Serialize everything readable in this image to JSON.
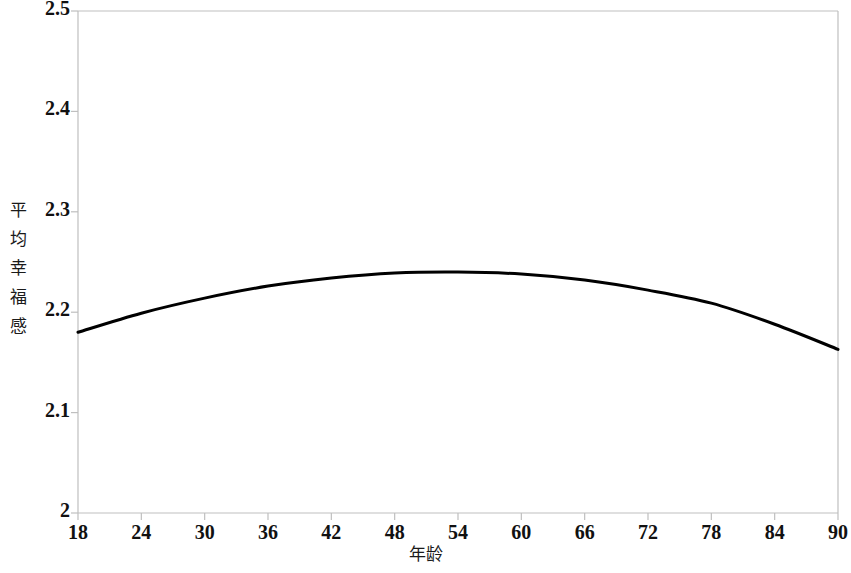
{
  "chart_data": {
    "type": "line",
    "title": "",
    "xlabel": "年龄",
    "ylabel": "平均幸福感",
    "xlim": [
      18,
      90
    ],
    "ylim": [
      2,
      2.5
    ],
    "xticks": [
      18,
      24,
      30,
      36,
      42,
      48,
      54,
      60,
      66,
      72,
      78,
      84,
      90
    ],
    "yticks": [
      2,
      2.1,
      2.2,
      2.3,
      2.4,
      2.5
    ],
    "ytick_labels": [
      "2",
      "2.1",
      "2.2",
      "2.3",
      "2.4",
      "2.5"
    ],
    "xtick_labels": [
      "18",
      "24",
      "30",
      "36",
      "42",
      "48",
      "54",
      "60",
      "66",
      "72",
      "78",
      "84",
      "90"
    ],
    "grid": false,
    "legend": null,
    "series": [
      {
        "name": "平均幸福感",
        "color": "#000000",
        "linewidth": 3,
        "x": [
          18,
          24,
          30,
          36,
          42,
          48,
          54,
          60,
          66,
          72,
          78,
          84,
          90
        ],
        "values": [
          2.18,
          2.199,
          2.214,
          2.226,
          2.234,
          2.239,
          2.24,
          2.238,
          2.232,
          2.222,
          2.209,
          2.188,
          2.163
        ]
      }
    ],
    "peak": {
      "x": 54,
      "y": 2.24
    },
    "axis_color": "#bfbfbf",
    "curve_color": "#000000"
  },
  "plot_geometry": {
    "left": 78,
    "right": 838,
    "top": 11,
    "bottom": 513
  }
}
